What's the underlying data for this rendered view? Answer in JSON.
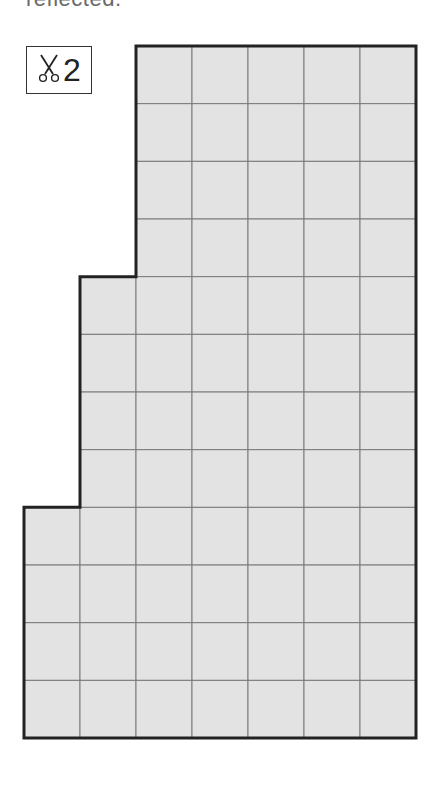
{
  "header": {
    "partial_text": "reflected."
  },
  "badge": {
    "icon": "scissors-icon",
    "count": "2"
  },
  "figure": {
    "fill_color": "#e3e3e3",
    "grid_line_color": "#7a7a7a",
    "outline_color": "#222222",
    "origin_x": 24,
    "origin_y": 46,
    "cell_w": 56,
    "cell_h": 57.67,
    "columns": 7,
    "rows": 12,
    "row_spans": [
      {
        "rows": [
          0,
          3
        ],
        "start_col": 2
      },
      {
        "rows": [
          4,
          7
        ],
        "start_col": 1
      },
      {
        "rows": [
          8,
          11
        ],
        "start_col": 0
      }
    ]
  }
}
